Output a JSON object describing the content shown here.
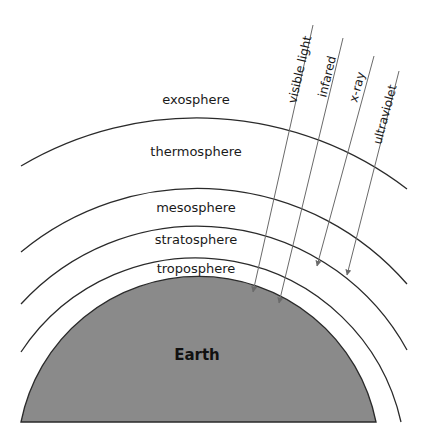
{
  "diagram": {
    "earth": {
      "label": "Earth",
      "fill": "#8a8a8a"
    },
    "layers": [
      {
        "id": "exosphere",
        "label": "exosphere"
      },
      {
        "id": "thermosphere",
        "label": "thermosphere"
      },
      {
        "id": "mesosphere",
        "label": "mesosphere"
      },
      {
        "id": "stratosphere",
        "label": "stratosphere"
      },
      {
        "id": "troposphere",
        "label": "troposphere"
      }
    ],
    "rays": [
      {
        "id": "visible-light",
        "label": "visible light",
        "ends_in": "Earth surface"
      },
      {
        "id": "infared",
        "label": "infared",
        "ends_in": "Earth surface"
      },
      {
        "id": "x-ray",
        "label": "x-ray",
        "ends_in": "stratosphere"
      },
      {
        "id": "ultraviolet",
        "label": "ultraviolet",
        "ends_in": "stratosphere"
      }
    ],
    "colors": {
      "line": "#2a2a2a",
      "ray": "#6a6a6a",
      "earth": "#8a8a8a",
      "background": "#ffffff"
    }
  }
}
